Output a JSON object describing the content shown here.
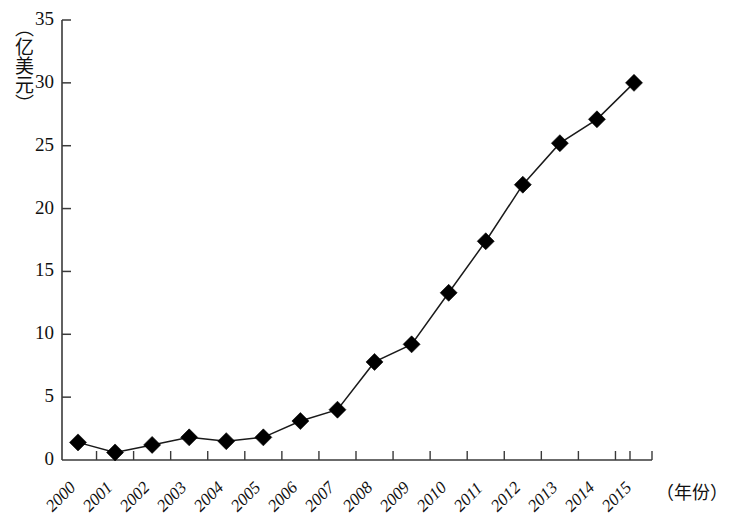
{
  "chart_data": {
    "type": "line",
    "title": "",
    "subtitle": "",
    "xlabel": "（年份）",
    "ylabel": "（亿美元）",
    "categories": [
      "2000",
      "2001",
      "2002",
      "2003",
      "2004",
      "2005",
      "2006",
      "2007",
      "2008",
      "2009",
      "2010",
      "2011",
      "2012",
      "2013",
      "2014",
      "2015"
    ],
    "values": [
      1.4,
      0.6,
      1.2,
      1.8,
      1.5,
      1.8,
      3.1,
      4.0,
      7.8,
      9.2,
      13.3,
      17.4,
      21.9,
      25.2,
      27.1,
      30.0
    ],
    "series": [
      {
        "name": "",
        "values": [
          1.4,
          0.6,
          1.2,
          1.8,
          1.5,
          1.8,
          3.1,
          4.0,
          7.8,
          9.2,
          13.3,
          17.4,
          21.9,
          25.2,
          27.1,
          30.0
        ]
      }
    ],
    "ylim": [
      0,
      35
    ],
    "ytick_labels": [
      "0",
      "5",
      "10",
      "15",
      "20",
      "25",
      "30",
      "35"
    ],
    "ytick_values": [
      0,
      5,
      10,
      15,
      20,
      25,
      30,
      35
    ],
    "xtick_labels": [
      "2000",
      "2001",
      "2002",
      "2003",
      "2004",
      "2005",
      "2006",
      "2007",
      "2008",
      "2009",
      "2010",
      "2011",
      "2012",
      "2013",
      "2014",
      "2015"
    ],
    "grid": false,
    "legend": null,
    "legend_position": "none",
    "marker": "diamond",
    "marker_color": "#000000",
    "line_color": "#1a1a1a",
    "axis_color": "#3a3a3a",
    "annotations": []
  },
  "axes": {
    "y_unit_label": "（亿美元）",
    "x_unit_label": "（年份）"
  }
}
